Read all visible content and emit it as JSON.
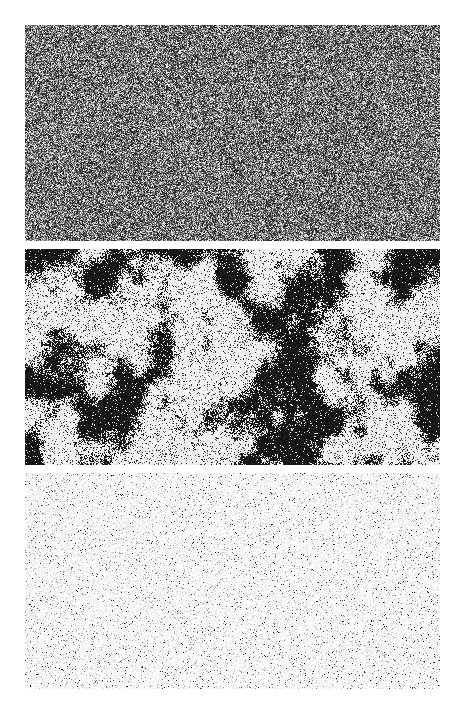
{
  "figure": {
    "background": "#ffffff",
    "panels": [
      {
        "id": "panel-1",
        "description": "Fine-grained gray random noise (disordered spin configuration)",
        "style": "gray-noise",
        "mean_gray": 0.42,
        "seed": 11
      },
      {
        "id": "panel-2",
        "description": "Large black and white clustered domains (near-critical configuration)",
        "style": "clusters",
        "black_fraction": 0.45,
        "seed": 23
      },
      {
        "id": "panel-3",
        "description": "Mostly white field with sparse dark speckles (ordered configuration)",
        "style": "sparse",
        "speckle_density": 0.06,
        "seed": 37
      }
    ]
  }
}
